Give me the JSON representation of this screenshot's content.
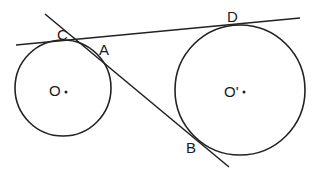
{
  "diagram": {
    "type": "two circles with common tangents",
    "colors": {
      "stroke": "#222222",
      "text": "#1a1a1a",
      "background": "#ffffff"
    },
    "circles": [
      {
        "name": "O",
        "label": "O",
        "cx": 63,
        "cy": 88,
        "r": 48
      },
      {
        "name": "O'",
        "label": "O'",
        "cx": 240,
        "cy": 90,
        "r": 65
      }
    ],
    "lines": [
      {
        "name": "external-tangent-CD",
        "x1": 16,
        "y1": 45,
        "x2": 300,
        "y2": 18
      },
      {
        "name": "internal-tangent-AB",
        "x1": 45,
        "y1": 14,
        "x2": 229,
        "y2": 167
      }
    ],
    "points": [
      {
        "label": "C",
        "x": 57,
        "y": 40
      },
      {
        "label": "A",
        "x": 99,
        "y": 55
      },
      {
        "label": "D",
        "x": 227,
        "y": 22
      },
      {
        "label": "B",
        "x": 186,
        "y": 153
      }
    ],
    "centers": [
      {
        "label": "O",
        "x": 49,
        "y": 96,
        "dotx": 66,
        "doty": 92
      },
      {
        "label": "O'",
        "x": 224,
        "y": 97,
        "dotx": 244,
        "doty": 92
      }
    ]
  }
}
